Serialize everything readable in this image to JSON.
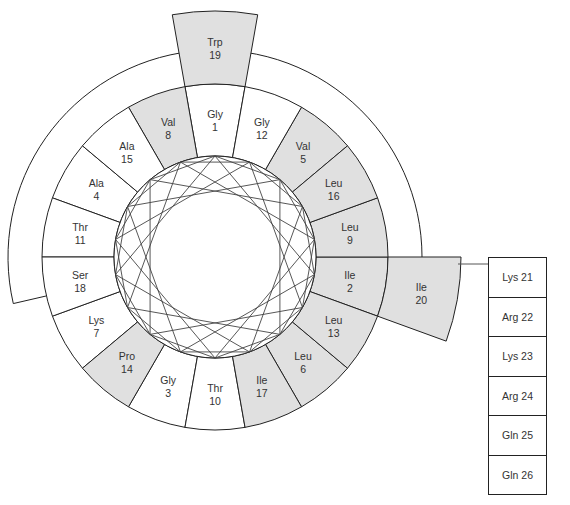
{
  "diagram": {
    "type": "helical-wheel",
    "colors": {
      "hydrophobic_fill": "#e0e0e0",
      "polar_fill": "#ffffff",
      "stroke": "#222222"
    },
    "wheel_residues": [
      {
        "n": 1,
        "name": "Gly",
        "shaded": false
      },
      {
        "n": 2,
        "name": "Ile",
        "shaded": true
      },
      {
        "n": 3,
        "name": "Gly",
        "shaded": false
      },
      {
        "n": 4,
        "name": "Ala",
        "shaded": false
      },
      {
        "n": 5,
        "name": "Val",
        "shaded": true
      },
      {
        "n": 6,
        "name": "Leu",
        "shaded": true
      },
      {
        "n": 7,
        "name": "Lys",
        "shaded": false
      },
      {
        "n": 8,
        "name": "Val",
        "shaded": true
      },
      {
        "n": 9,
        "name": "Leu",
        "shaded": true
      },
      {
        "n": 10,
        "name": "Thr",
        "shaded": false
      },
      {
        "n": 11,
        "name": "Thr",
        "shaded": false
      },
      {
        "n": 12,
        "name": "Gly",
        "shaded": false
      },
      {
        "n": 13,
        "name": "Leu",
        "shaded": true
      },
      {
        "n": 14,
        "name": "Pro",
        "shaded": true
      },
      {
        "n": 15,
        "name": "Ala",
        "shaded": false
      },
      {
        "n": 16,
        "name": "Leu",
        "shaded": true
      },
      {
        "n": 17,
        "name": "Ile",
        "shaded": true
      },
      {
        "n": 18,
        "name": "Ser",
        "shaded": false
      }
    ],
    "outer_residues": [
      {
        "n": 19,
        "name": "Trp",
        "shaded": true
      },
      {
        "n": 20,
        "name": "Ile",
        "shaded": true
      }
    ],
    "tail_residues": [
      {
        "label": "Lys 21"
      },
      {
        "label": "Arg 22"
      },
      {
        "label": "Lys 23"
      },
      {
        "label": "Arg 24"
      },
      {
        "label": "Gln 25"
      },
      {
        "label": "Gln 26"
      }
    ]
  }
}
